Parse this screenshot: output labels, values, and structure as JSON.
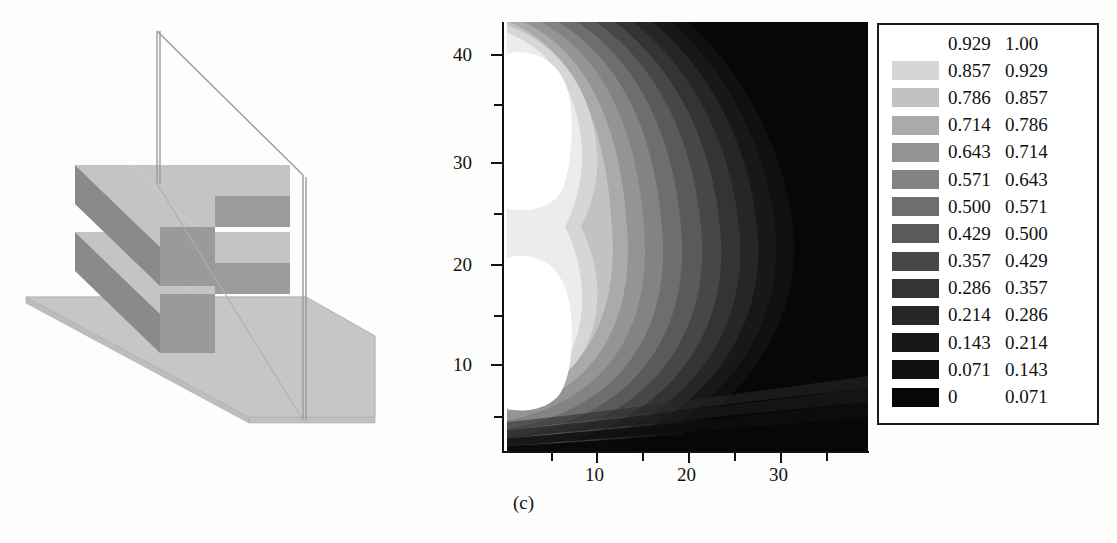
{
  "figure": {
    "caption": "(c)"
  },
  "diagram": {
    "name": "isometric-waveguide-diagram",
    "colors": {
      "base_plane": "#c6c6c6",
      "slab_top": "#c4c4c4",
      "slab_front": "#9a9a9a",
      "slab_side": "#8d8d8d",
      "rib_dark": "#8a8a8a",
      "outline": "#8b8b8b",
      "plane_edge": "#9a9a9a"
    }
  },
  "chart_data": {
    "type": "heatmap",
    "title": "",
    "subtitle": "",
    "xlabel": "",
    "ylabel": "",
    "xlim": [
      0,
      40
    ],
    "ylim": [
      0,
      45
    ],
    "grid": false,
    "legend_position": "right",
    "colormap": "grayscale-inverted",
    "x_ticks": [
      5,
      10,
      15,
      20,
      25,
      30,
      35
    ],
    "x_tick_labels": [
      "",
      "10",
      "",
      "20",
      "",
      "30",
      ""
    ],
    "y_ticks": [
      5,
      10,
      15,
      20,
      25,
      30,
      35,
      40
    ],
    "y_tick_labels": [
      "",
      "10",
      "",
      "20",
      "",
      "30",
      "",
      "40"
    ],
    "levels": [
      0,
      0.071,
      0.143,
      0.214,
      0.286,
      0.357,
      0.429,
      0.5,
      0.571,
      0.643,
      0.714,
      0.786,
      0.857,
      0.929,
      1.0
    ],
    "hotspots": [
      {
        "center_x": 8,
        "center_y": 33,
        "value": 1.0
      },
      {
        "center_x": 8,
        "center_y": 16,
        "value": 1.0
      }
    ],
    "annotations": [
      "(c)"
    ]
  },
  "legend": {
    "name": "contour-level-legend",
    "columns": [
      "low",
      "high"
    ],
    "rows": [
      {
        "low": "0.929",
        "high": "1.00",
        "color": "#ffffff",
        "blank": true
      },
      {
        "low": "0.857",
        "high": "0.929",
        "color": "#d6d6d6",
        "blank": false
      },
      {
        "low": "0.786",
        "high": "0.857",
        "color": "#c2c2c2",
        "blank": false
      },
      {
        "low": "0.714",
        "high": "0.786",
        "color": "#aaaaaa",
        "blank": false
      },
      {
        "low": "0.643",
        "high": "0.714",
        "color": "#949494",
        "blank": false
      },
      {
        "low": "0.571",
        "high": "0.643",
        "color": "#838383",
        "blank": false
      },
      {
        "low": "0.500",
        "high": "0.571",
        "color": "#6e6e6e",
        "blank": false
      },
      {
        "low": "0.429",
        "high": "0.500",
        "color": "#5a5a5a",
        "blank": false
      },
      {
        "low": "0.357",
        "high": "0.429",
        "color": "#474747",
        "blank": false
      },
      {
        "low": "0.286",
        "high": "0.357",
        "color": "#343434",
        "blank": false
      },
      {
        "low": "0.214",
        "high": "0.286",
        "color": "#262626",
        "blank": false
      },
      {
        "low": "0.143",
        "high": "0.214",
        "color": "#181818",
        "blank": false
      },
      {
        "low": "0.071",
        "high": "0.143",
        "color": "#101010",
        "blank": false
      },
      {
        "low": "0",
        "high": "0.071",
        "color": "#070707",
        "blank": false
      }
    ]
  },
  "axes": {
    "y_labels": [
      {
        "text": "40",
        "top": 44
      },
      {
        "text": "30",
        "top": 152
      },
      {
        "text": "20",
        "top": 254
      },
      {
        "text": "10",
        "top": 354
      }
    ],
    "x_labels": [
      {
        "text": "10",
        "left": 583
      },
      {
        "text": "20",
        "left": 676
      },
      {
        "text": "30",
        "left": 768
      }
    ]
  }
}
